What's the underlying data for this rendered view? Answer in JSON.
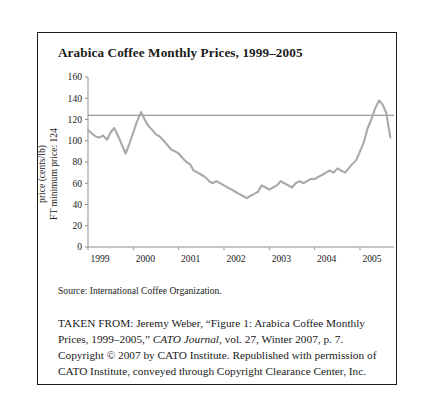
{
  "figure": {
    "title": "Arabica Coffee Monthly Prices, 1999–2005",
    "source_note": "Source: International Coffee Organization.",
    "caption": {
      "lead": "TAKEN FROM: Jeremy Weber, “Figure 1: Arabica Coffee Monthly Prices, 1999–2005,” ",
      "journal": "CATO Journal",
      "rest": ", vol. 27, Winter 2007, p. 7. Copyright © 2007 by CATO Institute. Republished with permission of CATO Institute, conveyed through Copyright Clearance Center, Inc."
    }
  },
  "chart_data": {
    "type": "line",
    "title": "Arabica Coffee Monthly Prices, 1999–2005",
    "xlabel": "",
    "ylabel": "price (cents/lb)",
    "ylabel2": "FT minimum price: 124",
    "ylim": [
      0,
      160
    ],
    "yticks": [
      0,
      20,
      40,
      60,
      80,
      100,
      120,
      140,
      160
    ],
    "xticks": [
      "1999",
      "2000",
      "2001",
      "2002",
      "2003",
      "2004",
      "2005"
    ],
    "xlim": [
      1999,
      2005.75
    ],
    "grid": false,
    "legend": null,
    "line_color": "#a9a9a9",
    "reference_line": {
      "label": "FT minimum price",
      "value": 124,
      "color": "#7d7d7d"
    },
    "series": [
      {
        "name": "Arabica coffee price (cents/lb)",
        "x": [
          1999.0,
          1999.08,
          1999.17,
          1999.25,
          1999.33,
          1999.42,
          1999.5,
          1999.58,
          1999.67,
          1999.75,
          1999.83,
          1999.92,
          2000.0,
          2000.08,
          2000.17,
          2000.25,
          2000.33,
          2000.42,
          2000.5,
          2000.58,
          2000.67,
          2000.75,
          2000.83,
          2000.92,
          2001.0,
          2001.08,
          2001.17,
          2001.25,
          2001.33,
          2001.42,
          2001.5,
          2001.58,
          2001.67,
          2001.75,
          2001.83,
          2001.92,
          2002.0,
          2002.08,
          2002.17,
          2002.25,
          2002.33,
          2002.42,
          2002.5,
          2002.58,
          2002.67,
          2002.75,
          2002.83,
          2002.92,
          2003.0,
          2003.08,
          2003.17,
          2003.25,
          2003.33,
          2003.42,
          2003.5,
          2003.58,
          2003.67,
          2003.75,
          2003.83,
          2003.92,
          2004.0,
          2004.08,
          2004.17,
          2004.25,
          2004.33,
          2004.42,
          2004.5,
          2004.58,
          2004.67,
          2004.75,
          2004.83,
          2004.92,
          2005.0,
          2005.08,
          2005.17,
          2005.25,
          2005.33,
          2005.42,
          2005.5,
          2005.58,
          2005.67
        ],
        "values": [
          110,
          107,
          104,
          103,
          105,
          101,
          108,
          112,
          104,
          96,
          88,
          98,
          108,
          118,
          127,
          120,
          114,
          110,
          106,
          104,
          100,
          96,
          92,
          90,
          88,
          84,
          80,
          78,
          72,
          70,
          68,
          66,
          62,
          60,
          62,
          60,
          58,
          56,
          54,
          52,
          50,
          48,
          46,
          48,
          50,
          52,
          58,
          56,
          54,
          56,
          58,
          62,
          60,
          58,
          56,
          60,
          62,
          60,
          62,
          64,
          64,
          66,
          68,
          70,
          72,
          70,
          74,
          72,
          70,
          74,
          78,
          82,
          90,
          98,
          112,
          120,
          130,
          138,
          134,
          126,
          103
        ]
      }
    ]
  }
}
